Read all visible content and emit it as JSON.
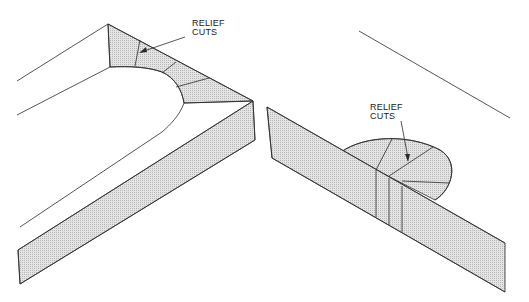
{
  "figures": [
    {
      "id": "left",
      "description": "Isometric view of mitered corner with rounded inner edge showing relief cuts",
      "label_line1": "RELIEF",
      "label_line2": "CUTS"
    },
    {
      "id": "right",
      "description": "Isometric view of strip with semicircular bump showing relief cuts",
      "label_line1": "RELIEF",
      "label_line2": "CUTS"
    }
  ],
  "colors": {
    "line": "#2a2a2a",
    "hatch": "#c8c8c8",
    "background": "#ffffff"
  }
}
